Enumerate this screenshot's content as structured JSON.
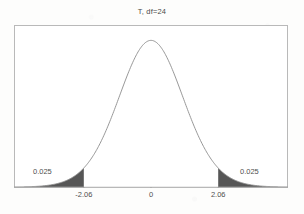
{
  "chart_data": {
    "type": "line",
    "title": "T, df=24",
    "xlabel": "",
    "ylabel": "",
    "distribution": "Student t",
    "df": 24,
    "grid": false,
    "legend": null,
    "xlim": [
      -4.2,
      4.2
    ],
    "ylim": [
      0,
      0.42
    ],
    "x_tick_labels": [
      "-2.06",
      "0",
      "2.06"
    ],
    "x_tick_values": [
      -2.06,
      0,
      2.06
    ],
    "series": [
      {
        "name": "t density (df=24)",
        "x": [
          -4.2,
          -3.9,
          -3.6,
          -3.3,
          -3.0,
          -2.7,
          -2.4,
          -2.06,
          -1.8,
          -1.5,
          -1.2,
          -0.9,
          -0.6,
          -0.3,
          0,
          0.3,
          0.6,
          0.9,
          1.2,
          1.5,
          1.8,
          2.06,
          2.4,
          2.7,
          3.0,
          3.3,
          3.6,
          3.9,
          4.2
        ],
        "y": [
          0.0013,
          0.0024,
          0.0043,
          0.0077,
          0.0135,
          0.0232,
          0.0387,
          0.0573,
          0.0806,
          0.1225,
          0.177,
          0.2412,
          0.3084,
          0.3647,
          0.3876,
          0.3647,
          0.3084,
          0.2412,
          0.177,
          0.1225,
          0.0806,
          0.0573,
          0.0387,
          0.0232,
          0.0135,
          0.0077,
          0.0043,
          0.0024,
          0.0013
        ]
      }
    ],
    "shaded_regions": [
      {
        "name": "left-tail",
        "from": -4.2,
        "to": -2.06,
        "area_label": "0.025",
        "area": 0.025
      },
      {
        "name": "right-tail",
        "from": 2.06,
        "to": 4.2,
        "area_label": "0.025",
        "area": 0.025
      }
    ],
    "annotations": [
      {
        "name": "left-tail-probability",
        "text": "0.025"
      },
      {
        "name": "right-tail-probability",
        "text": "0.025"
      }
    ],
    "colors": {
      "curve": "#8c8c8c",
      "shade": "#565656",
      "frame": "#b9b9b9",
      "text": "#4f4f4f",
      "background": "#ffffff"
    }
  },
  "labels": {
    "prob_left": "0.025",
    "prob_right": "0.025"
  }
}
